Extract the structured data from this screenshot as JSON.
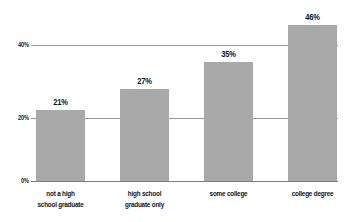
{
  "chart_data": {
    "type": "bar",
    "title": "",
    "subtitle": "",
    "xlabel": "",
    "ylabel": "",
    "categories": [
      "not a high school graduate",
      "high school graduate only",
      "some college",
      "college degree"
    ],
    "category_lines": [
      [
        "not a high",
        "school graduate"
      ],
      [
        "high school",
        "graduate only"
      ],
      [
        "some college",
        ""
      ],
      [
        "college degree",
        ""
      ]
    ],
    "values": [
      21,
      27,
      35,
      46
    ],
    "value_labels": [
      "21%",
      "27%",
      "35%",
      "46%"
    ],
    "ylim": [
      0,
      50
    ],
    "yticks": [
      0,
      20,
      40
    ],
    "ytick_labels": [
      "0%",
      "20%",
      "40%"
    ],
    "grid": true,
    "grid_axis": "y",
    "legend": "none",
    "bar_color": "#a9a9a9",
    "grid_color": "#9a9a9a",
    "axis_color": "#7d7d7d",
    "label_color": "#121212"
  }
}
